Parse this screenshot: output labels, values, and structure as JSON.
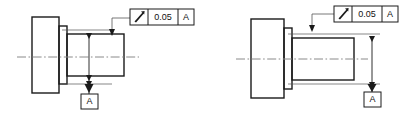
{
  "drawing": {
    "title": "Circular runout tolerance example",
    "background_color": "#ffffff",
    "line_color": "#1a1a1a",
    "thin_line_color": "#555555",
    "centerline_color": "#888888"
  },
  "views": [
    {
      "id": "left-view",
      "name": "Stepped shaft with flange - runout on shaft diameter",
      "feature_control_frame": {
        "symbol_name": "circular-runout-symbol",
        "symbol_label": "circular runout",
        "tolerance_value": "0.05",
        "datum_reference": "A"
      },
      "datum_feature": {
        "label": "A",
        "name": "datum-feature-a",
        "position": "bottom"
      },
      "dimension": {
        "name": "runout-extent-dimension",
        "orientation": "vertical",
        "position": "interior"
      },
      "centerline": {
        "name": "axis-centerline",
        "style": "dash-dot"
      }
    },
    {
      "id": "right-view",
      "name": "Stepped shaft with flange - runout on shaft end",
      "feature_control_frame": {
        "symbol_name": "circular-runout-symbol",
        "symbol_label": "circular runout",
        "tolerance_value": "0.05",
        "datum_reference": "A"
      },
      "datum_feature": {
        "label": "A",
        "name": "datum-feature-a",
        "position": "bottom-right"
      },
      "dimension": {
        "name": "runout-extent-dimension",
        "orientation": "vertical",
        "position": "right"
      },
      "centerline": {
        "name": "axis-centerline",
        "style": "dash-dot"
      }
    }
  ]
}
